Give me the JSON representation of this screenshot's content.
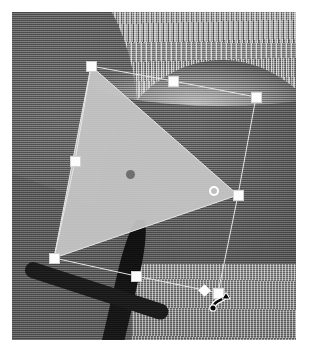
{
  "app": {
    "view_name": "image-canvas",
    "mode": "free-transform",
    "cursor": "rotate-cursor"
  },
  "canvas": {
    "width": 322,
    "height": 360,
    "background_color": "#ffffff",
    "photo": {
      "name": "grayscale-photo",
      "left": 12,
      "top": 12,
      "width": 284,
      "height": 328,
      "base_color": "#8e8e8e",
      "regions": [
        {
          "name": "streaked-texture-top",
          "tone": "#a4a4a4"
        },
        {
          "name": "dark-dome-shape",
          "tone": "#5c5c5c"
        },
        {
          "name": "dark-left-mass",
          "tone": "#606060"
        },
        {
          "name": "black-diagonal-band",
          "tone": "#141414"
        },
        {
          "name": "light-bottom-patch",
          "tone": "#9b9b9b"
        }
      ]
    }
  },
  "selection": {
    "name": "triangle-selection",
    "shape": "triangle",
    "fill_color": "#c8c8c8",
    "fill_opacity": 0.92,
    "outline_color": "#e8e8e8",
    "vertices": [
      {
        "x": 91,
        "y": 66
      },
      {
        "x": 238,
        "y": 195
      },
      {
        "x": 54,
        "y": 258
      }
    ],
    "pivot": {
      "name": "pivot-point",
      "x": 130,
      "y": 174,
      "color": "#6f6f6f"
    },
    "marker_ring": {
      "name": "anchor-ring",
      "x": 214,
      "y": 191,
      "color": "#ffffff"
    }
  },
  "transform_box": {
    "name": "transform-outline",
    "stroke_color": "#e6e6e6",
    "stroke_width": 1,
    "path": [
      {
        "x": 91,
        "y": 66
      },
      {
        "x": 173,
        "y": 81
      },
      {
        "x": 256,
        "y": 97
      },
      {
        "x": 238,
        "y": 195
      },
      {
        "x": 218,
        "y": 293
      },
      {
        "x": 204,
        "y": 290
      },
      {
        "x": 136,
        "y": 276
      },
      {
        "x": 54,
        "y": 258
      },
      {
        "x": 75,
        "y": 161
      }
    ],
    "handles": [
      {
        "name": "handle-top-left",
        "x": 91,
        "y": 66,
        "type": "square"
      },
      {
        "name": "handle-top-middle",
        "x": 173,
        "y": 81,
        "type": "square"
      },
      {
        "name": "handle-top-right",
        "x": 256,
        "y": 97,
        "type": "square"
      },
      {
        "name": "handle-right-middle",
        "x": 238,
        "y": 195,
        "type": "square"
      },
      {
        "name": "handle-bottom-right",
        "x": 218,
        "y": 293,
        "type": "square"
      },
      {
        "name": "handle-bottom-diamond",
        "x": 204,
        "y": 290,
        "type": "diamond"
      },
      {
        "name": "handle-bottom-middle",
        "x": 136,
        "y": 276,
        "type": "square"
      },
      {
        "name": "handle-bottom-left",
        "x": 54,
        "y": 258,
        "type": "square"
      },
      {
        "name": "handle-left-middle",
        "x": 75,
        "y": 161,
        "type": "square"
      }
    ]
  },
  "cursor": {
    "name": "rotate-cursor",
    "color": "#050505",
    "x": 209,
    "y": 289
  }
}
